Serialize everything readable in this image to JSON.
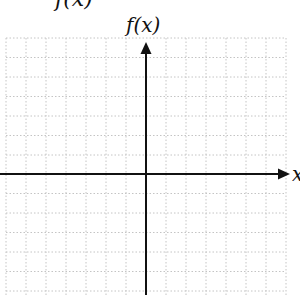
{
  "diagram": {
    "type": "coordinate-grid",
    "top_cropped_text": "f(x)",
    "y_axis_label": "f(x)",
    "x_axis_label": "x",
    "colors": {
      "axis": "#111111",
      "grid": "#bdbdbd",
      "background": "#ffffff"
    },
    "grid": {
      "columns": 14,
      "rows_visible": 13,
      "style": "dotted"
    }
  }
}
